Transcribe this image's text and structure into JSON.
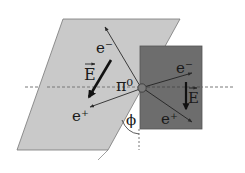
{
  "diagram": {
    "colors": {
      "background": "#ffffff",
      "left_plane": "#c9c9c9",
      "right_plane": "#6d6d6d",
      "lines": "#2a2a2a",
      "dashed": "#555555",
      "pion": "#7a7a7a"
    },
    "labels": {
      "pion": "π⁰",
      "left_electron": "e⁻",
      "left_positron": "e⁺",
      "left_field": "E",
      "right_electron": "e⁻",
      "right_positron": "e⁺",
      "right_field": "E",
      "angle": "ϕ"
    },
    "nodes": [
      {
        "id": "pion",
        "label": "π⁰",
        "x": 142,
        "y": 88
      },
      {
        "id": "left_electron",
        "label": "e⁻",
        "x": 105,
        "y": 27
      },
      {
        "id": "left_positron",
        "label": "e⁺",
        "x": 90,
        "y": 107
      },
      {
        "id": "right_electron",
        "label": "e⁻",
        "x": 192,
        "y": 73
      },
      {
        "id": "right_positron",
        "label": "e⁺",
        "x": 192,
        "y": 122
      }
    ],
    "edges": [
      {
        "from": "pion",
        "to": "left_electron",
        "type": "arrow"
      },
      {
        "from": "pion",
        "to": "left_positron",
        "type": "arrow"
      },
      {
        "from": "pion",
        "to": "right_electron",
        "type": "arrow"
      },
      {
        "from": "pion",
        "to": "right_positron",
        "type": "arrow"
      }
    ],
    "field_vectors": [
      {
        "plane": "left",
        "label": "E",
        "from": [
          111,
          60
        ],
        "to": [
          88,
          98
        ]
      },
      {
        "plane": "right",
        "label": "E",
        "from": [
          187,
          82
        ],
        "to": [
          187,
          110
        ]
      }
    ]
  }
}
